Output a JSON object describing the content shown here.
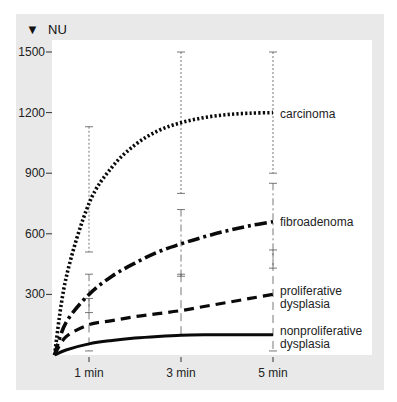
{
  "chart_data": {
    "type": "line",
    "title": "",
    "ylabel": "NU",
    "ylabel_marker": "▼",
    "xlabel": "",
    "x_ticks": [
      {
        "t": 1,
        "label": "1 min"
      },
      {
        "t": 3,
        "label": "3 min"
      },
      {
        "t": 5,
        "label": "5 min"
      }
    ],
    "y_ticks": [
      {
        "v": 300,
        "label": "300"
      },
      {
        "v": 600,
        "label": "600"
      },
      {
        "v": 900,
        "label": "900"
      },
      {
        "v": 1200,
        "label": "1200"
      },
      {
        "v": 1500,
        "label": "1500"
      }
    ],
    "ylim": [
      0,
      1500
    ],
    "xlim": [
      0,
      5
    ],
    "grid": false,
    "legend_position": "inline-right",
    "series": [
      {
        "name": "carcinoma",
        "label_lines": [
          "carcinoma"
        ],
        "style": "dotted",
        "x": [
          0.25,
          0.5,
          1,
          1.5,
          2,
          2.5,
          3,
          3.5,
          4,
          4.5,
          5
        ],
        "y": [
          0,
          380,
          750,
          930,
          1040,
          1110,
          1150,
          1175,
          1190,
          1197,
          1200
        ],
        "error_bars": [
          {
            "t": 1,
            "low": 510,
            "high": 1130
          },
          {
            "t": 3,
            "low": 800,
            "high": 1500
          },
          {
            "t": 5,
            "low": 900,
            "high": 1500
          }
        ]
      },
      {
        "name": "fibroadenoma",
        "label_lines": [
          "fibroadenoma"
        ],
        "style": "dash-dot",
        "x": [
          0.25,
          0.5,
          1,
          1.5,
          2,
          2.5,
          3,
          3.5,
          4,
          4.5,
          5
        ],
        "y": [
          0,
          160,
          300,
          390,
          455,
          510,
          550,
          585,
          615,
          640,
          660
        ],
        "error_bars": [
          {
            "t": 1,
            "low": 210,
            "high": 400
          },
          {
            "t": 3,
            "low": 390,
            "high": 720
          },
          {
            "t": 5,
            "low": 430,
            "high": 850
          }
        ]
      },
      {
        "name": "proliferative dysplasia",
        "label_lines": [
          "proliferative",
          "dysplasia"
        ],
        "style": "dashed",
        "x": [
          0.25,
          0.5,
          1,
          1.5,
          2,
          2.5,
          3,
          3.5,
          4,
          4.5,
          5
        ],
        "y": [
          0,
          90,
          150,
          170,
          190,
          205,
          220,
          240,
          260,
          280,
          300
        ],
        "error_bars": [
          {
            "t": 1,
            "low": 20,
            "high": 280
          },
          {
            "t": 3,
            "low": 100,
            "high": 400
          },
          {
            "t": 5,
            "low": 20,
            "high": 520
          }
        ]
      },
      {
        "name": "nonproliferative dysplasia",
        "label_lines": [
          "nonproliferative",
          "dysplasia"
        ],
        "style": "solid",
        "x": [
          0.25,
          0.5,
          1,
          1.5,
          2,
          2.5,
          3,
          3.5,
          4,
          4.5,
          5
        ],
        "y": [
          0,
          25,
          55,
          72,
          84,
          92,
          98,
          100,
          100,
          100,
          100
        ],
        "error_bars": []
      }
    ]
  }
}
